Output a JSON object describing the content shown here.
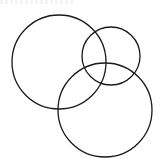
{
  "diagram": {
    "type": "overlapping-circles",
    "background": "#ffffff",
    "stroke_color": "#1a1a1a",
    "stroke_width": 1.3,
    "circles": [
      {
        "id": "large-left",
        "cx": 59,
        "cy": 62,
        "r": 47
      },
      {
        "id": "small-right",
        "cx": 111,
        "cy": 56,
        "r": 29
      },
      {
        "id": "large-bottom",
        "cx": 105,
        "cy": 110,
        "r": 47
      }
    ]
  }
}
